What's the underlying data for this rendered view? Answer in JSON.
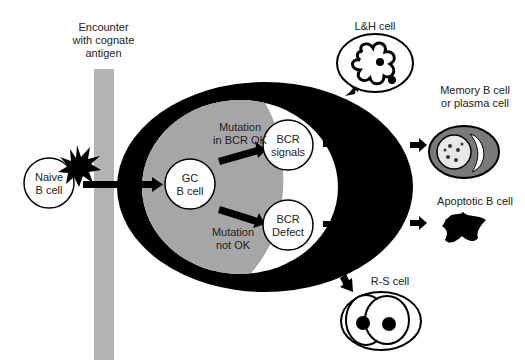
{
  "labels": {
    "encounter": [
      "Encounter",
      "with cognate",
      "antigen"
    ],
    "naive_b_cell": [
      "Naive",
      "B cell"
    ],
    "gc_b_cell": [
      "GC",
      "B cell"
    ],
    "mutation_ok": [
      "Mutation",
      "in BCR OK"
    ],
    "mutation_not_ok": [
      "Mutation",
      "not OK"
    ],
    "bcr_signals": [
      "BCR",
      "signals"
    ],
    "bcr_defect": [
      "BCR",
      "Defect"
    ],
    "lh_cell": "L&H cell",
    "memory_cell": [
      "Memory B cell",
      "or plasma cell"
    ],
    "apoptotic_cell": "Apoptotic B cell",
    "rs_cell": "R-S cell"
  },
  "colors": {
    "black": "#000000",
    "gray_region": "#a6a6a6",
    "antigen_bar": "#b3b3b3",
    "white": "#ffffff",
    "memory_ring": "#7a7a7a"
  }
}
